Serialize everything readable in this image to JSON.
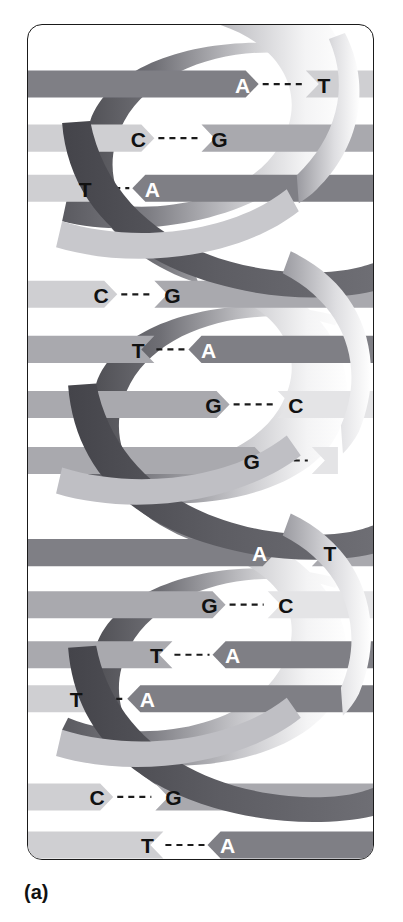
{
  "figure": {
    "caption": "(a)",
    "frame": {
      "border_color": "#1a1a1a",
      "background": "#ffffff"
    }
  },
  "colors": {
    "ribbon_dark": "#55555a",
    "ribbon_mid": "#8d8d92",
    "ribbon_light": "#e8e8ea",
    "ribbon_white": "#fdfdfd",
    "base_dark": "#7f7f85",
    "base_mid": "#a9a9ae",
    "base_light": "#cfcfd2",
    "base_pale": "#e4e4e6",
    "letter_on_dark": "#ffffff",
    "letter_on_light": "#111111",
    "hbond": "#1a1a1a",
    "outline": "#1a1a1a"
  },
  "helix": {
    "strand_count": 2,
    "turns": 3,
    "strand_labels": [
      "backbone-strand-left",
      "backbone-strand-right"
    ],
    "hbond_style": "dashed",
    "hbond_dash_count": 3
  },
  "chart_data": {
    "type": "diagram",
    "base_pairs": [
      {
        "index": 1,
        "left": "A",
        "right": "T",
        "left_shade": "dark",
        "right_shade": "light",
        "direction": "right",
        "y": 83,
        "lx": 238,
        "rx": 319
      },
      {
        "index": 2,
        "left": "C",
        "right": "G",
        "left_shade": "light",
        "right_shade": "mid",
        "direction": "right",
        "y": 137,
        "lx": 134,
        "rx": 215
      },
      {
        "index": 3,
        "left": "T",
        "right": "A",
        "left_shade": "light",
        "right_shade": "dark",
        "direction": "left",
        "y": 187,
        "lx": 81,
        "rx": 148
      },
      {
        "index": 4,
        "left": "C",
        "right": "G",
        "left_shade": "light",
        "right_shade": "mid",
        "direction": "right",
        "y": 293,
        "lx": 97,
        "rx": 168
      },
      {
        "index": 5,
        "left": "T",
        "right": "A",
        "left_shade": "mid",
        "right_shade": "dark",
        "direction": "left",
        "y": 348,
        "lx": 134,
        "rx": 204
      },
      {
        "index": 6,
        "left": "G",
        "right": "C",
        "left_shade": "mid",
        "right_shade": "pale",
        "direction": "right",
        "y": 403,
        "lx": 209,
        "rx": 291
      },
      {
        "index": 7,
        "left": "G",
        "right": "",
        "left_shade": "mid",
        "right_shade": "pale",
        "direction": "right",
        "y": 459,
        "lx": 247,
        "rx": 325,
        "partner_hidden": true
      },
      {
        "index": 8,
        "left": "A",
        "right": "T",
        "left_shade": "dark",
        "right_shade": "mid",
        "direction": "right",
        "y": 551,
        "lx": 255,
        "rx": 325
      },
      {
        "index": 9,
        "left": "G",
        "right": "C",
        "left_shade": "mid",
        "right_shade": "pale",
        "direction": "right",
        "y": 603,
        "lx": 205,
        "rx": 281
      },
      {
        "index": 10,
        "left": "T",
        "right": "A",
        "left_shade": "mid",
        "right_shade": "dark",
        "direction": "left",
        "y": 653,
        "lx": 152,
        "rx": 228
      },
      {
        "index": 11,
        "left": "T",
        "right": "A",
        "left_shade": "light",
        "right_shade": "dark",
        "direction": "left",
        "y": 697,
        "lx": 72,
        "rx": 143
      },
      {
        "index": 12,
        "left": "C",
        "right": "G",
        "left_shade": "light",
        "right_shade": "mid",
        "direction": "right",
        "y": 795,
        "lx": 93,
        "rx": 169
      },
      {
        "index": 13,
        "left": "T",
        "right": "A",
        "left_shade": "light",
        "right_shade": "dark",
        "direction": "left",
        "y": 843,
        "lx": 143,
        "rx": 223
      }
    ],
    "base_pair_sequence_left": [
      "A",
      "C",
      "T",
      "C",
      "T",
      "G",
      "G",
      "A",
      "G",
      "T",
      "T",
      "C",
      "T"
    ],
    "base_pair_sequence_right": [
      "T",
      "G",
      "A",
      "G",
      "A",
      "C",
      "",
      "T",
      "C",
      "A",
      "A",
      "G",
      "A"
    ],
    "pair_count": 13,
    "annotations": [
      "(a)"
    ]
  }
}
